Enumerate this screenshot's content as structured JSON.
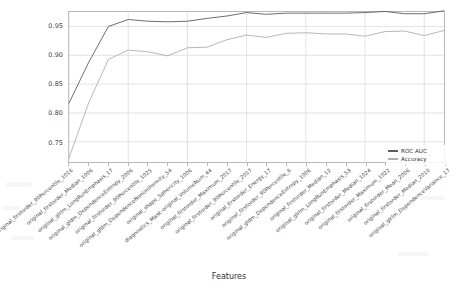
{
  "chart_data": {
    "type": "line",
    "title": "",
    "xlabel": "Features",
    "ylabel": "",
    "grid": true,
    "legend_position": "center-right",
    "ylim": [
      0.715,
      0.975
    ],
    "yticks": [
      "0.75",
      "0.80",
      "0.85",
      "0.90",
      "0.95"
    ],
    "ytick_values": [
      0.75,
      0.8,
      0.85,
      0.9,
      0.95
    ],
    "categories": [
      "original_firstorder_90Percentile_1016",
      "original_firstorder_Median_1006",
      "original_glrlm_LongRunEmphasis_17",
      "original_gldm_DependenceEntropy_2006",
      "original_firstorder_90Percentile_1025",
      "original_gldm_DependenceNonUniformity_54",
      "original_shape_Sphericity_1006",
      "diagnostics_Mask-original_VolumeNum_44",
      "original_firstorder_Maximum_2017",
      "original_firstorder_90Percentile_2017",
      "original_firstorder_Energy_17",
      "original_firstorder_90Percentile_8",
      "original_gldm_DependenceEntropy_1006",
      "original_firstorder_Median_12",
      "original_glrlm_LongRunEmphasis_53",
      "original_firstorder_Median_1024",
      "original_firstorder_Maximum_1022",
      "original_firstorder_Mean_2006",
      "original_firstorder_Median_2010",
      "original_glrlm_DependenceVariance_17"
    ],
    "series": [
      {
        "name": "ROC AUC",
        "color": "#5b5b5b",
        "values": [
          0.817,
          0.888,
          0.95,
          0.962,
          0.959,
          0.958,
          0.959,
          0.964,
          0.968,
          0.974,
          0.971,
          0.973,
          0.973,
          0.973,
          0.973,
          0.974,
          0.976,
          0.972,
          0.972,
          0.977
        ]
      },
      {
        "name": "Accuracy",
        "color": "#aeaeae",
        "values": [
          0.722,
          0.818,
          0.893,
          0.909,
          0.906,
          0.899,
          0.913,
          0.914,
          0.927,
          0.935,
          0.931,
          0.938,
          0.939,
          0.937,
          0.937,
          0.933,
          0.941,
          0.942,
          0.934,
          0.943
        ]
      }
    ]
  },
  "legend": {
    "entries": [
      {
        "label": "ROC AUC",
        "color": "#5b5b5b"
      },
      {
        "label": "Accuracy",
        "color": "#aeaeae"
      }
    ]
  },
  "axis": {
    "x_title": "Features"
  },
  "colors": {
    "roc_auc": "#5b5b5b",
    "accuracy": "#aeaeae",
    "grid": "#d7d7d7",
    "spine": "#b9b9b9",
    "text": "#3b3b3b",
    "background": "#ffffff"
  }
}
